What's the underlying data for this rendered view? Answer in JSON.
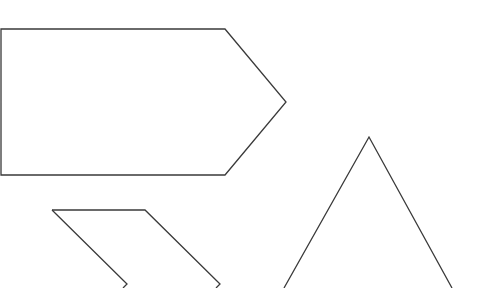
{
  "canvas": {
    "width": 489,
    "height": 288,
    "background": "#ffffff"
  },
  "style": {
    "stroke": "#3a3a3a",
    "stroke_width": 1.3
  },
  "shapes": [
    {
      "name": "pentagon-arrow",
      "type": "polygon",
      "points": "1,29 225,29 286,102 225,175 1,175"
    },
    {
      "name": "chevron-left-stroke",
      "type": "polyline",
      "points": "52,210 127,284 123,288"
    },
    {
      "name": "chevron-top-stroke",
      "type": "polyline",
      "points": "52,210 145,210 220,284 216,288"
    },
    {
      "name": "triangle",
      "type": "polyline",
      "points": "284,288 369,137 452,288"
    }
  ]
}
